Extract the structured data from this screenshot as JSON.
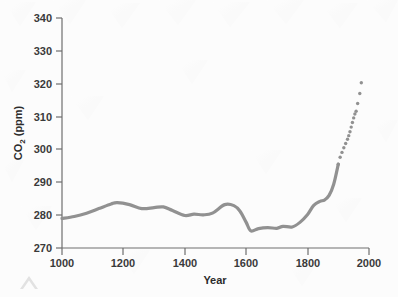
{
  "figure": {
    "background_color": "#fcfcfc",
    "line_color": "#919191",
    "axis_color": "#6e6e6e",
    "text_color": "#3a3a3a",
    "watermark_present": true,
    "corner_mark": "chevron-watermark"
  },
  "chart_data": {
    "type": "line",
    "title": "",
    "xlabel": "Year",
    "ylabel": "CO2 (ppm)",
    "ylabel_parts": {
      "prefix": "CO",
      "subscript": "2",
      "suffix": " (ppm)"
    },
    "xlim": [
      1000,
      2000
    ],
    "ylim": [
      270,
      340
    ],
    "xticks": [
      1000,
      1200,
      1400,
      1600,
      1800,
      2000
    ],
    "xtick_labels": [
      "1000",
      "1200",
      "1400",
      "1600",
      "1800",
      "2000"
    ],
    "yticks": [
      270,
      280,
      290,
      300,
      310,
      320,
      330,
      340
    ],
    "ytick_labels": [
      "270",
      "280",
      "290",
      "300",
      "310",
      "320",
      "330",
      "340"
    ],
    "grid": false,
    "legend": null,
    "series": [
      {
        "name": "Atmospheric CO2 (ice core, smoothed)",
        "style": "solid-line",
        "color": "#919191",
        "x": [
          1000,
          1040,
          1080,
          1120,
          1160,
          1180,
          1220,
          1260,
          1300,
          1330,
          1360,
          1400,
          1430,
          1460,
          1490,
          1530,
          1560,
          1580,
          1600,
          1615,
          1640,
          1670,
          1700,
          1720,
          1750,
          1775,
          1800,
          1820,
          1840,
          1855,
          1870,
          1885,
          1900
        ],
        "y": [
          279.0,
          279.6,
          280.6,
          282.0,
          283.4,
          283.8,
          283.2,
          282.0,
          282.3,
          282.5,
          281.4,
          279.9,
          280.3,
          280.1,
          280.6,
          283.2,
          282.9,
          281.2,
          277.8,
          275.2,
          275.9,
          276.2,
          276.0,
          276.6,
          276.4,
          277.8,
          280.2,
          283.0,
          284.2,
          284.6,
          286.0,
          289.4,
          295.5
        ]
      },
      {
        "name": "Atmospheric CO2 (measured, dotted)",
        "style": "dotted-markers",
        "color": "#919191",
        "x": [
          1900,
          1906,
          1912,
          1918,
          1924,
          1930,
          1934,
          1938,
          1942,
          1946,
          1950,
          1954,
          1958,
          1963,
          1970
        ],
        "y": [
          295.5,
          297.6,
          299.1,
          300.5,
          301.8,
          303.1,
          304.2,
          305.4,
          306.8,
          308.2,
          309.6,
          310.8,
          311.6,
          314.0,
          317.0
        ]
      },
      {
        "name": "Topmost observation",
        "style": "dotted-markers",
        "color": "#919191",
        "x": [
          1975
        ],
        "y": [
          320.3
        ]
      }
    ],
    "annotations": []
  }
}
